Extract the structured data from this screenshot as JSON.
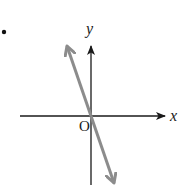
{
  "diagram": {
    "type": "coordinate-plane-line",
    "bullet": "•",
    "axes": {
      "x_label": "x",
      "y_label": "y",
      "origin_label": "O",
      "axis_color": "#1a1a1a"
    },
    "line": {
      "description": "straight line through the origin with steep negative slope",
      "color": "#8c8c8c",
      "through_origin": true,
      "slope_sign": "negative",
      "arrows_both_ends": true
    }
  }
}
